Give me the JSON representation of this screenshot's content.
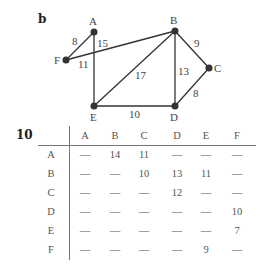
{
  "figure": {
    "graph_label": "b",
    "table_label": "10"
  },
  "graph": {
    "nodes": [
      {
        "id": "A",
        "x": 94,
        "y": 32
      },
      {
        "id": "B",
        "x": 175,
        "y": 31
      },
      {
        "id": "C",
        "x": 209,
        "y": 68
      },
      {
        "id": "D",
        "x": 175,
        "y": 106
      },
      {
        "id": "E",
        "x": 94,
        "y": 106
      },
      {
        "id": "F",
        "x": 66,
        "y": 60
      }
    ],
    "edges": [
      {
        "from": "A",
        "to": "F",
        "weight": "8"
      },
      {
        "from": "A",
        "to": "E",
        "weight": "15"
      },
      {
        "from": "F",
        "to": "B",
        "weight": "11"
      },
      {
        "from": "E",
        "to": "B",
        "weight": "17"
      },
      {
        "from": "B",
        "to": "D",
        "weight": "13"
      },
      {
        "from": "B",
        "to": "C",
        "weight": "9"
      },
      {
        "from": "C",
        "to": "D",
        "weight": "8"
      },
      {
        "from": "E",
        "to": "D",
        "weight": "10"
      }
    ]
  },
  "table": {
    "columns": [
      "A",
      "B",
      "C",
      "D",
      "E",
      "F"
    ],
    "rows": [
      {
        "label": "A",
        "cells": [
          "—",
          "14",
          "11",
          "—",
          "—",
          "—"
        ]
      },
      {
        "label": "B",
        "cells": [
          "—",
          "—",
          "10",
          "13",
          "11",
          "—"
        ]
      },
      {
        "label": "C",
        "cells": [
          "—",
          "—",
          "—",
          "12",
          "—",
          "—"
        ]
      },
      {
        "label": "D",
        "cells": [
          "—",
          "—",
          "—",
          "—",
          "—",
          "10"
        ]
      },
      {
        "label": "E",
        "cells": [
          "—",
          "—",
          "—",
          "—",
          "—",
          "7"
        ]
      },
      {
        "label": "F",
        "cells": [
          "—",
          "—",
          "—",
          "—",
          "9",
          "—"
        ]
      }
    ]
  }
}
